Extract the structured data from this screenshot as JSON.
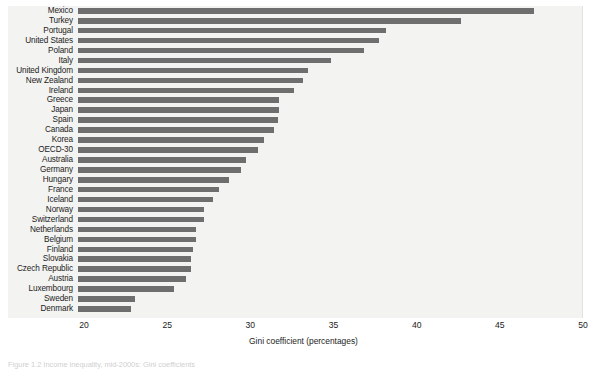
{
  "chart_data": {
    "type": "bar",
    "orientation": "horizontal",
    "title": "",
    "xlabel": "Gini coefficient (percentages)",
    "ylabel": "",
    "xlim": [
      20,
      50
    ],
    "xticks": [
      20,
      25,
      30,
      35,
      40,
      45,
      50
    ],
    "grid": false,
    "legend": null,
    "bar_color": "#6e6e6e",
    "plot_background": "#f3f3f1",
    "categories": [
      "Mexico",
      "Turkey",
      "Portugal",
      "United States",
      "Poland",
      "Italy",
      "United Kingdom",
      "New Zealand",
      "Ireland",
      "Greece",
      "Japan",
      "Spain",
      "Canada",
      "Korea",
      "OECD-30",
      "Australia",
      "Germany",
      "Hungary",
      "France",
      "Iceland",
      "Norway",
      "Switzerland",
      "Netherlands",
      "Belgium",
      "Finland",
      "Slovakia",
      "Czech Republic",
      "Austria",
      "Luxembourg",
      "Sweden",
      "Denmark"
    ],
    "values": [
      47.4,
      43.0,
      38.5,
      38.1,
      37.2,
      35.2,
      33.8,
      33.5,
      33.0,
      32.1,
      32.1,
      32.0,
      31.8,
      31.2,
      30.8,
      30.1,
      29.8,
      29.1,
      28.5,
      28.1,
      27.6,
      27.6,
      27.1,
      27.1,
      26.9,
      26.8,
      26.8,
      26.5,
      25.8,
      23.4,
      23.2
    ]
  },
  "axis": {
    "tick_labels": [
      "20",
      "25",
      "30",
      "35",
      "40",
      "45",
      "50"
    ],
    "title": "Gini coefficient (percentages)"
  },
  "caption": {
    "text": "Figure 1.2 Income inequality, mid-2000s: Gini coefficients"
  }
}
